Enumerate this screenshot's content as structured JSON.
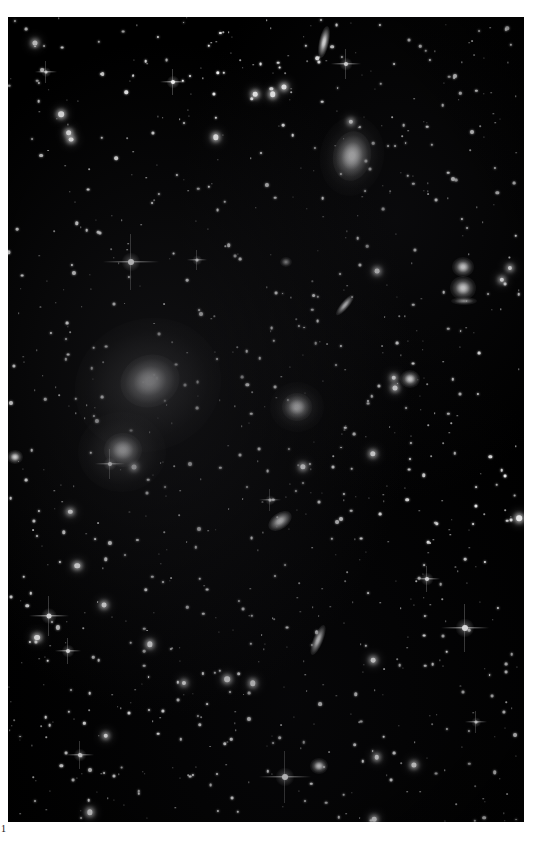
{
  "figure": {
    "label": "1",
    "caption_visible": false
  },
  "plate": {
    "name": "deep-sky-photographic-plate",
    "background_color": "#000000",
    "page_color": "#ffffff",
    "frame": {
      "x": 8,
      "y": 17,
      "width": 516,
      "height": 805
    },
    "subject": "galaxy cluster star field",
    "star_color": "#ffffff"
  },
  "galaxies": [
    {
      "name": "bright-elliptical-galaxy-primary",
      "x": 150,
      "y": 381,
      "rx": 30,
      "ry": 26,
      "angle": -20,
      "kind": "ell"
    },
    {
      "name": "bright-elliptical-galaxy-primary-halo",
      "x": 148,
      "y": 385,
      "rx": 74,
      "ry": 66,
      "angle": -20,
      "kind": "halo"
    },
    {
      "name": "bright-elliptical-galaxy-secondary",
      "x": 123,
      "y": 450,
      "rx": 19,
      "ry": 17,
      "angle": 0,
      "kind": "ell"
    },
    {
      "name": "bright-elliptical-galaxy-secondary-halo",
      "x": 122,
      "y": 452,
      "rx": 44,
      "ry": 40,
      "angle": 0,
      "kind": "halo"
    },
    {
      "name": "lenticular-galaxy-upper-right",
      "x": 352,
      "y": 156,
      "rx": 19,
      "ry": 25,
      "angle": 10,
      "kind": "ell"
    },
    {
      "name": "lenticular-galaxy-upper-right-halo",
      "x": 352,
      "y": 156,
      "rx": 32,
      "ry": 40,
      "angle": 10,
      "kind": "halo"
    },
    {
      "name": "edge-on-spiral-galaxy-top",
      "x": 324,
      "y": 42,
      "rx": 5,
      "ry": 16,
      "angle": 12,
      "kind": "edge"
    },
    {
      "name": "elliptical-galaxy-center",
      "x": 297,
      "y": 407,
      "rx": 15,
      "ry": 14,
      "angle": 0,
      "kind": "ell"
    },
    {
      "name": "elliptical-galaxy-center-halo",
      "x": 297,
      "y": 407,
      "rx": 27,
      "ry": 25,
      "angle": 0,
      "kind": "halo"
    },
    {
      "name": "round-galaxy-right-upper",
      "x": 463,
      "y": 267,
      "rx": 11,
      "ry": 10,
      "angle": 0,
      "kind": "ell"
    },
    {
      "name": "round-galaxy-right-lower",
      "x": 463,
      "y": 288,
      "rx": 13,
      "ry": 12,
      "angle": 0,
      "kind": "ell"
    },
    {
      "name": "lens-arc-galaxy-right",
      "x": 464,
      "y": 301,
      "rx": 13,
      "ry": 4,
      "angle": 0,
      "kind": "faint"
    },
    {
      "name": "round-galaxy-mid-right",
      "x": 410,
      "y": 379,
      "rx": 10,
      "ry": 9,
      "angle": 0,
      "kind": "ell"
    },
    {
      "name": "edge-on-spiral-galaxy-mid",
      "x": 345,
      "y": 305,
      "rx": 4,
      "ry": 13,
      "angle": 40,
      "kind": "edge"
    },
    {
      "name": "inclined-spiral-galaxy-lower-mid",
      "x": 280,
      "y": 521,
      "rx": 8,
      "ry": 13,
      "angle": 55,
      "kind": "edge"
    },
    {
      "name": "edge-on-spiral-galaxy-lower",
      "x": 318,
      "y": 640,
      "rx": 5,
      "ry": 16,
      "angle": 22,
      "kind": "edge"
    },
    {
      "name": "round-galaxy-bottom",
      "x": 319,
      "y": 766,
      "rx": 9,
      "ry": 8,
      "angle": 0,
      "kind": "ell"
    },
    {
      "name": "small-galaxy-left-edge",
      "x": 15,
      "y": 457,
      "rx": 8,
      "ry": 7,
      "angle": 0,
      "kind": "ell"
    },
    {
      "name": "faint-galaxy-mid-left",
      "x": 286,
      "y": 262,
      "rx": 6,
      "ry": 5,
      "angle": 0,
      "kind": "faint"
    }
  ],
  "spike_stars": [
    {
      "name": "bright-star-upper-left",
      "x": 131,
      "y": 262,
      "core": 6,
      "span": 56
    },
    {
      "name": "bright-star-upper-mid",
      "x": 465,
      "y": 628,
      "core": 6,
      "span": 48
    },
    {
      "name": "bright-star-left-lower",
      "x": 49,
      "y": 616,
      "core": 5,
      "span": 40
    },
    {
      "name": "bright-star-top-right",
      "x": 346,
      "y": 64,
      "core": 4,
      "span": 30
    },
    {
      "name": "bright-star-bottom-mid",
      "x": 285,
      "y": 777,
      "core": 6,
      "span": 52
    },
    {
      "name": "bright-star-near-galaxy",
      "x": 110,
      "y": 464,
      "core": 4,
      "span": 30
    },
    {
      "name": "bright-star-left-mid",
      "x": 68,
      "y": 651,
      "core": 4,
      "span": 26
    },
    {
      "name": "bright-star-upper-far-left",
      "x": 46,
      "y": 72,
      "core": 3,
      "span": 22
    },
    {
      "name": "bright-star-upper-center",
      "x": 173,
      "y": 82,
      "core": 4,
      "span": 26
    },
    {
      "name": "bright-star-mid-right",
      "x": 427,
      "y": 579,
      "core": 4,
      "span": 26
    },
    {
      "name": "bright-star-lower-left",
      "x": 80,
      "y": 755,
      "core": 4,
      "span": 28
    },
    {
      "name": "bright-star-mid-left",
      "x": 197,
      "y": 260,
      "core": 3,
      "span": 20
    },
    {
      "name": "bright-star-right-lower",
      "x": 476,
      "y": 722,
      "core": 3,
      "span": 22
    },
    {
      "name": "bright-star-center-lower",
      "x": 270,
      "y": 500,
      "core": 3,
      "span": 22
    }
  ],
  "field": {
    "star_count": 940,
    "description": "dense stellar background field"
  }
}
